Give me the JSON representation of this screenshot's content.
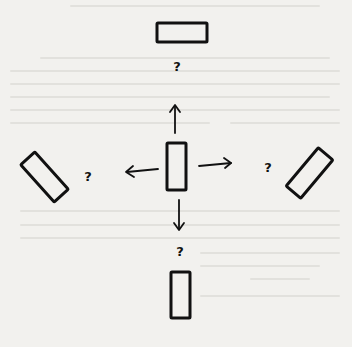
{
  "diagram": {
    "ink_color": "#111111",
    "paper_color": "#f2f1ee",
    "center": {
      "shape": "rectangle",
      "orientation": "vertical"
    },
    "outcomes": [
      {
        "direction": "up",
        "shape": "rectangle",
        "orientation": "horizontal",
        "label": "?"
      },
      {
        "direction": "left",
        "shape": "rectangle",
        "orientation": "tilted-45-backslash",
        "label": "?"
      },
      {
        "direction": "right",
        "shape": "rectangle",
        "orientation": "tilted-45-slash",
        "label": "?"
      },
      {
        "direction": "down",
        "shape": "rectangle",
        "orientation": "vertical",
        "label": "?"
      }
    ]
  }
}
